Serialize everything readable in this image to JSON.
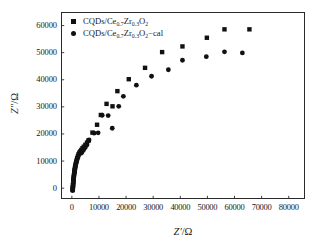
{
  "chart_data": {
    "type": "scatter",
    "title": "",
    "xlabel": "Z'/Ω",
    "ylabel": "Z\"/Ω",
    "xlim": [
      -4000,
      86000
    ],
    "ylim": [
      -4000,
      65000
    ],
    "xticks": [
      0,
      10000,
      20000,
      30000,
      40000,
      50000,
      60000,
      70000,
      80000
    ],
    "xtick_labels": [
      "0",
      "10000",
      "20000",
      "30000",
      "40000",
      "50000",
      "60000",
      "70000",
      "80000"
    ],
    "yticks": [
      0,
      10000,
      20000,
      30000,
      40000,
      50000,
      60000
    ],
    "ytick_labels": [
      "0",
      "10000",
      "20000",
      "30000",
      "40000",
      "50000",
      "60000"
    ],
    "grid": false,
    "legend_position": "top-left",
    "series": [
      {
        "name": "CQDs/Ce0.7Zr0.3O2",
        "marker": "square",
        "color": "#111111",
        "points": [
          [
            300,
            -700
          ],
          [
            350,
            -100
          ],
          [
            400,
            500
          ],
          [
            450,
            1200
          ],
          [
            500,
            1900
          ],
          [
            560,
            2600
          ],
          [
            620,
            3300
          ],
          [
            700,
            4000
          ],
          [
            780,
            4800
          ],
          [
            870,
            5500
          ],
          [
            960,
            6200
          ],
          [
            1060,
            6900
          ],
          [
            1180,
            7600
          ],
          [
            1300,
            8300
          ],
          [
            1450,
            9000
          ],
          [
            1620,
            9700
          ],
          [
            1800,
            10400
          ],
          [
            2000,
            11100
          ],
          [
            2250,
            11800
          ],
          [
            2500,
            12500
          ],
          [
            2800,
            13100
          ],
          [
            3150,
            13600
          ],
          [
            3500,
            14100
          ],
          [
            3900,
            14700
          ],
          [
            4400,
            15300
          ],
          [
            5000,
            16000
          ],
          [
            5600,
            16800
          ],
          [
            6200,
            17600
          ],
          [
            7600,
            20500
          ],
          [
            9300,
            23400
          ],
          [
            10700,
            27000
          ],
          [
            12800,
            31100
          ],
          [
            15000,
            30200
          ],
          [
            16800,
            35800
          ],
          [
            21000,
            40200
          ],
          [
            27000,
            44400
          ],
          [
            33300,
            50200
          ],
          [
            40800,
            52300
          ],
          [
            49800,
            55500
          ],
          [
            56300,
            58600
          ],
          [
            65500,
            58600
          ]
        ]
      },
      {
        "name": "CQDs/Ce0.7Zr0.3O2−cal",
        "marker": "circle",
        "color": "#111111",
        "points": [
          [
            280,
            -900
          ],
          [
            330,
            -300
          ],
          [
            380,
            300
          ],
          [
            430,
            1000
          ],
          [
            490,
            1700
          ],
          [
            550,
            2400
          ],
          [
            610,
            3100
          ],
          [
            690,
            3800
          ],
          [
            770,
            4500
          ],
          [
            860,
            5200
          ],
          [
            950,
            5900
          ],
          [
            1050,
            6600
          ],
          [
            1170,
            7300
          ],
          [
            1290,
            8000
          ],
          [
            1430,
            8700
          ],
          [
            1600,
            9400
          ],
          [
            1790,
            10100
          ],
          [
            1990,
            10800
          ],
          [
            2230,
            11500
          ],
          [
            2480,
            12200
          ],
          [
            2780,
            12800
          ],
          [
            3130,
            13300
          ],
          [
            3480,
            12900
          ],
          [
            3880,
            13500
          ],
          [
            4380,
            14200
          ],
          [
            4950,
            15000
          ],
          [
            5550,
            15900
          ],
          [
            6150,
            17500
          ],
          [
            6350,
            17800
          ],
          [
            8200,
            20300
          ],
          [
            9700,
            20400
          ],
          [
            11200,
            26900
          ],
          [
            13400,
            26800
          ],
          [
            14900,
            22100
          ],
          [
            17300,
            30200
          ],
          [
            19000,
            33900
          ],
          [
            23800,
            38000
          ],
          [
            29400,
            41300
          ],
          [
            35600,
            43700
          ],
          [
            40800,
            47200
          ],
          [
            49600,
            48500
          ],
          [
            56300,
            50300
          ],
          [
            62900,
            49900
          ]
        ]
      }
    ]
  },
  "legend": {
    "items": [
      {
        "marker": "square",
        "prefix": "CQDs/Ce",
        "sub1": "0.7",
        "mid": "Zr",
        "sub2": "0.3",
        "post": "O",
        "sub3": "2",
        "suffix": ""
      },
      {
        "marker": "circle",
        "prefix": "CQDs/Ce",
        "sub1": "0.7",
        "mid": "Zr",
        "sub2": "0.3",
        "post": "O",
        "sub3": "2",
        "suffix": "−cal"
      }
    ]
  },
  "axes": {
    "x_title_symbol": "Z′",
    "x_title_unit": "/Ω",
    "y_title_symbol": "Z″",
    "y_title_unit": "/Ω"
  }
}
